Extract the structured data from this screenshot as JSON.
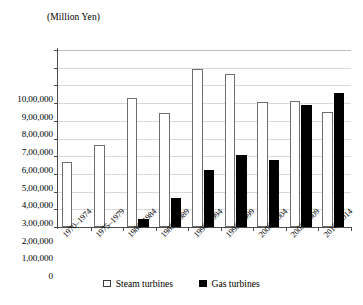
{
  "chart_data": {
    "type": "bar",
    "title": "",
    "subtitle": "",
    "unit_label": "(Million Yen)",
    "xlabel": "",
    "ylabel": "",
    "ylim": [
      0,
      1000000
    ],
    "ytick_step": 100000,
    "grid": true,
    "legend_position": "bottom",
    "categories": [
      "1970–1974",
      "1975–1979",
      "1980–1984",
      "1985–1989",
      "1990–1994",
      "1995–1999",
      "2000–2004",
      "2005–2009",
      "2010–2014"
    ],
    "ytick_labels": [
      "0",
      "1,00,000",
      "2,00,000",
      "3,00,000",
      "4,00,000",
      "5,00,000",
      "6,00,000",
      "7,00,000",
      "8,00,000",
      "9,00,000",
      "10,00,000"
    ],
    "series": [
      {
        "name": "Steam turbines",
        "color": "#ffffff",
        "edge_color": "#6e6e6e",
        "values": [
          370000,
          465000,
          730000,
          645000,
          895000,
          865000,
          705000,
          710000,
          650000
        ]
      },
      {
        "name": "Gas turbines",
        "color": "#000000",
        "edge_color": "#000000",
        "values": [
          0,
          0,
          45000,
          165000,
          320000,
          405000,
          380000,
          690000,
          755000
        ]
      }
    ]
  },
  "legend": {
    "items": [
      {
        "label": "Steam turbines",
        "swatch": "hollow-square"
      },
      {
        "label": "Gas turbines",
        "swatch": "filled-square"
      }
    ]
  }
}
